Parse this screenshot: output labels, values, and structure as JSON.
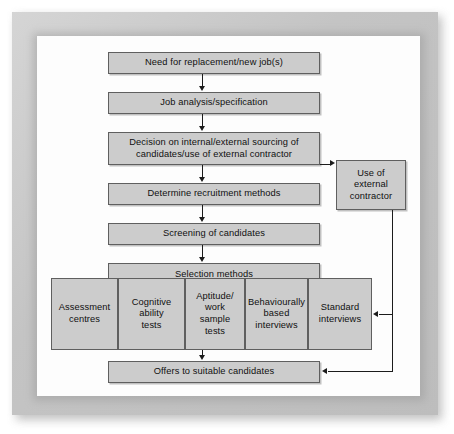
{
  "diagram": {
    "colors": {
      "node_fill": "#cccccc",
      "node_border": "#5f5f5f",
      "connector": "#1c1c1c",
      "canvas": "#fdfdfd",
      "frame": "#c4c4c4"
    },
    "main_flow": [
      {
        "id": "need",
        "label": "Need for replacement/new job(s)"
      },
      {
        "id": "analysis",
        "label": "Job analysis/specification"
      },
      {
        "id": "decision",
        "label": "Decision on internal/external sourcing of\ncandidates/use of external contractor"
      },
      {
        "id": "methods",
        "label": "Determine recruitment methods"
      },
      {
        "id": "screening",
        "label": "Screening of candidates"
      },
      {
        "id": "selection",
        "label": "Selection methods"
      },
      {
        "id": "offers",
        "label": "Offers to suitable candidates"
      }
    ],
    "side_node": {
      "id": "contractor",
      "label": "Use of\nexternal\ncontractor"
    },
    "selection_methods": [
      {
        "id": "assessment-centres",
        "label": "Assessment\ncentres"
      },
      {
        "id": "cognitive-ability",
        "label": "Cognitive\nability\ntests"
      },
      {
        "id": "aptitude-work-sample",
        "label": "Aptitude/\nwork\nsample\ntests"
      },
      {
        "id": "behaviourally-based",
        "label": "Behaviourally\nbased\ninterviews"
      },
      {
        "id": "standard-interviews",
        "label": "Standard\ninterviews"
      }
    ]
  }
}
